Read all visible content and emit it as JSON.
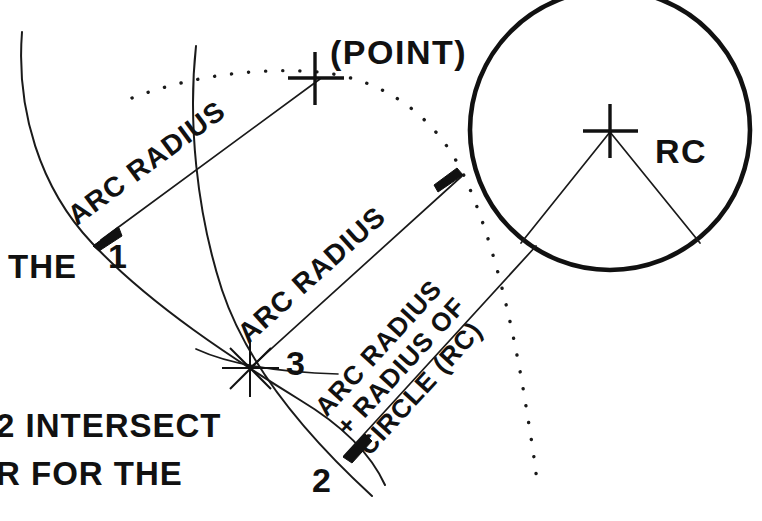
{
  "figure": {
    "type": "geometric-construction-diagram",
    "background_color": "#ffffff",
    "ink_color": "#111111",
    "width": 762,
    "height": 521
  },
  "labels": {
    "point_label": "(POINT)",
    "rc_label": "RC",
    "arc_radius_upper": "ARC RADIUS",
    "arc_radius_middle": "ARC RADIUS",
    "arc_radius_lower_line1": "ARC RADIUS",
    "arc_radius_lower_line2": "+ RADIUS OF",
    "arc_radius_lower_line3": "CIRCLE (RC)",
    "point_1": "1",
    "point_2": "2",
    "point_3": "3",
    "text_the": "THE",
    "text_intersect": "2 INTERSECT",
    "text_for_the": "R FOR THE"
  },
  "markers": {
    "point_cross": "cross-marker",
    "circle_center_cross": "cross-marker",
    "intersection_star": "star-marker"
  },
  "geometry": {
    "circle_center": [
      610,
      130
    ],
    "circle_radius": 140,
    "point_position": [
      315,
      75
    ],
    "point_1_position": [
      95,
      243
    ],
    "point_2_position": [
      345,
      455
    ],
    "point_3_position": [
      250,
      368
    ]
  }
}
